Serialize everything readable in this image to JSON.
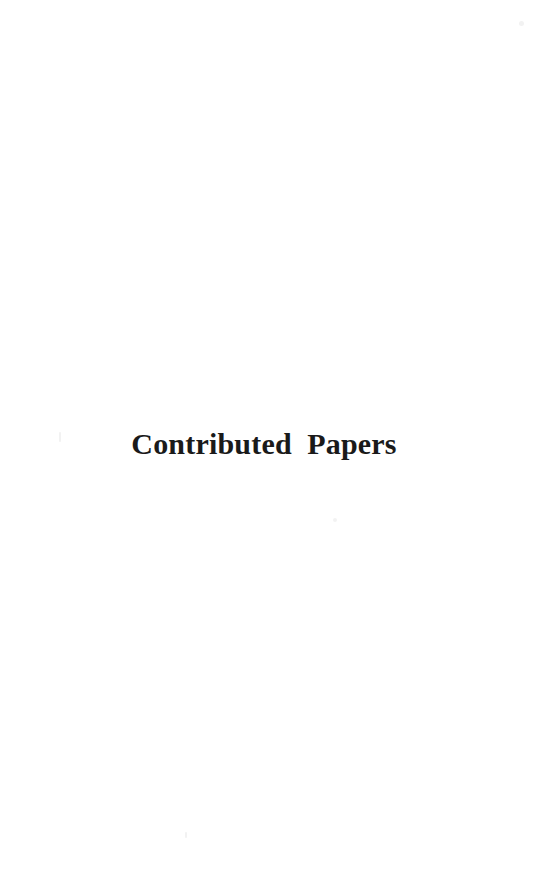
{
  "page": {
    "background_color": "#ffffff",
    "width": 544,
    "height": 884
  },
  "content": {
    "section_title": "Contributed  Papers",
    "text_color": "#1a1a1a"
  },
  "artifacts": {
    "speck_color": "#f2f2f2"
  }
}
